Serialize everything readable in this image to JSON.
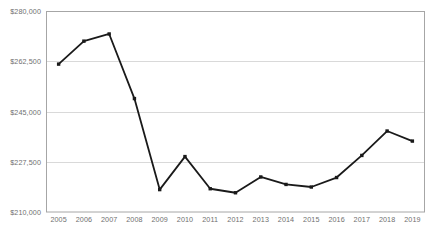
{
  "chart_data": {
    "type": "line",
    "title": "",
    "subtitle": "",
    "xlabel": "",
    "ylabel": "",
    "categories": [
      "2005",
      "2006",
      "2007",
      "2008",
      "2009",
      "2010",
      "2011",
      "2012",
      "2013",
      "2014",
      "2015",
      "2016",
      "2017",
      "2018",
      "2019"
    ],
    "series": [
      {
        "name": "",
        "values": [
          261500,
          269500,
          272000,
          249500,
          217800,
          229300,
          218100,
          216700,
          222200,
          219600,
          218700,
          222000,
          229700,
          238200,
          234700
        ]
      }
    ],
    "ylim": [
      210000,
      280000
    ],
    "ytick_values": [
      210000,
      227500,
      245000,
      262500,
      280000
    ],
    "ytick_labels": [
      "$210,000",
      "$227,500",
      "$245,000",
      "$262,500",
      "$280,000"
    ],
    "xtick_labels": [
      "2005",
      "2006",
      "2007",
      "2008",
      "2009",
      "2010",
      "2011",
      "2012",
      "2013",
      "2014",
      "2015",
      "2016",
      "2017",
      "2018",
      "2019"
    ],
    "grid": true,
    "grid_axis": "y",
    "legend": false,
    "legend_position": "none",
    "marker": "square",
    "line_color": "#1a1a1a",
    "marker_color": "#1a1a1a",
    "grid_color": "#d9d9d9",
    "border_color": "#a6a6a6",
    "label_color": "#6f6f6f",
    "background_color": "#ffffff"
  },
  "plot_geometry": {
    "left": 46,
    "right": 425,
    "top": 11,
    "bottom": 212
  }
}
